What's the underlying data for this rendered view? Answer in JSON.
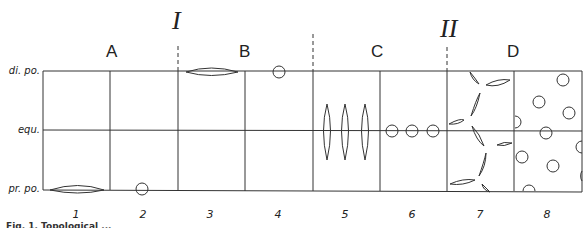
{
  "diagram": {
    "type": "stage-grid",
    "stages": [
      {
        "label": "A",
        "columns": [
          1,
          2
        ]
      },
      {
        "label": "B",
        "columns": [
          3,
          4
        ]
      },
      {
        "label": "C",
        "columns": [
          5,
          6
        ]
      },
      {
        "label": "D",
        "columns": [
          7,
          8
        ]
      }
    ],
    "transitions": [
      {
        "label": "I",
        "between": [
          "A",
          "B"
        ]
      },
      {
        "label": "II",
        "between": [
          "C",
          "D"
        ]
      }
    ],
    "row_labels": [
      "di. po.",
      "equ.",
      "pr. po."
    ],
    "column_labels": [
      "1",
      "2",
      "3",
      "4",
      "5",
      "6",
      "7",
      "8"
    ],
    "cells": [
      {
        "column": "1",
        "content": "elongated lens shape lying on proximal pole line"
      },
      {
        "column": "2",
        "content": "circle on proximal pole line"
      },
      {
        "column": "3",
        "content": "elongated lens shape lying on distal pole line"
      },
      {
        "column": "4",
        "content": "circle on distal pole line"
      },
      {
        "column": "5",
        "content": "three vertical lens shapes crossing equator"
      },
      {
        "column": "6",
        "content": "three circles on equator"
      },
      {
        "column": "7",
        "content": "many lens shapes scattered randomly"
      },
      {
        "column": "8",
        "content": "many circles scattered randomly"
      }
    ],
    "caption": "Fig. 1. Topological ..."
  },
  "labels": {
    "phase_a": "A",
    "phase_b": "B",
    "phase_c": "C",
    "phase_d": "D",
    "roman_1": "I",
    "roman_2": "II",
    "row_distal": "di. po.",
    "row_equator": "equ.",
    "row_proximal": "pr. po.",
    "col": [
      "1",
      "2",
      "3",
      "4",
      "5",
      "6",
      "7",
      "8"
    ],
    "caption": "Fig. 1. Topological ..."
  }
}
